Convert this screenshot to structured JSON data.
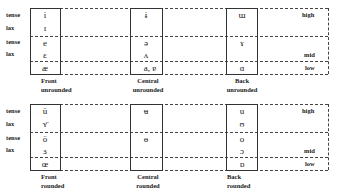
{
  "charts": [
    {
      "name": "unrounded",
      "row_labels": [
        "tense",
        "lax",
        "tense",
        "lax"
      ],
      "height_labels": [
        "high",
        "mid",
        "low"
      ],
      "columns": [
        {
          "label_line1": "Front",
          "label_line2": "unrounded",
          "symbols": {
            "high_tense": "i",
            "high_lax": "ɪ",
            "mid_tense": "e",
            "mid_lax": "ɛ",
            "low": "æ"
          }
        },
        {
          "label_line1": "Central",
          "label_line2": "unrounded",
          "symbols": {
            "high_tense": "ɨ",
            "high_lax": "",
            "mid_tense": "ə",
            "mid_lax": "ʌ",
            "low": "a, ɐ"
          }
        },
        {
          "label_line1": "Back",
          "label_line2": "unrounded",
          "symbols": {
            "high_tense": "ɯ",
            "high_lax": "",
            "mid_tense": "ɤ",
            "mid_lax": "",
            "low": "ɑ"
          }
        }
      ]
    },
    {
      "name": "rounded",
      "row_labels": [
        "tense",
        "lax",
        "tense",
        "lax"
      ],
      "height_labels": [
        "high",
        "mid",
        "low"
      ],
      "columns": [
        {
          "label_line1": "Front",
          "label_line2": "rounded",
          "symbols": {
            "high_tense": "ü",
            "high_lax": "ʏ̈",
            "mid_tense": "ö",
            "mid_lax": "ɜ",
            "low": "œ"
          }
        },
        {
          "label_line1": "Central",
          "label_line2": "rounded",
          "symbols": {
            "high_tense": "ʉ",
            "high_lax": "",
            "mid_tense": "ɵ",
            "mid_lax": "",
            "low": ""
          }
        },
        {
          "label_line1": "Back",
          "label_line2": "rounded",
          "symbols": {
            "high_tense": "u",
            "high_lax": "ʊ",
            "mid_tense": "o",
            "mid_lax": "ɔ",
            "low": "ɒ"
          }
        }
      ]
    }
  ]
}
